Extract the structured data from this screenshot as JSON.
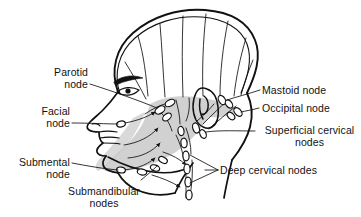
{
  "figure": {
    "type": "anatomical-line-diagram",
    "background_color": "#ffffff",
    "ink_color": "#111111",
    "shading_color": "#c9c9c9",
    "node_fill_color": "#ffffff"
  },
  "labels": {
    "parotid": {
      "line1": "Parotid",
      "line2": "node"
    },
    "facial": {
      "line1": "Facial",
      "line2": "node"
    },
    "submental": {
      "line1": "Submental",
      "line2": "node"
    },
    "submandibular": {
      "line1": "Submandibular",
      "line2": "nodes"
    },
    "mastoid": {
      "line1": "Mastoid node"
    },
    "occipital": {
      "line1": "Occipital node"
    },
    "superficial_cervical": {
      "line1": "Superficial cervical",
      "line2": "nodes"
    },
    "deep_cervical": {
      "line1": "Deep cervical nodes"
    }
  },
  "node_groups": [
    {
      "name": "parotid-node",
      "count": 3
    },
    {
      "name": "facial-node",
      "count": 1
    },
    {
      "name": "submental-node",
      "count": 1
    },
    {
      "name": "submandibular-nodes",
      "count": 3
    },
    {
      "name": "mastoid-node",
      "count": 2
    },
    {
      "name": "occipital-node",
      "count": 2
    },
    {
      "name": "superficial-cervical-nodes",
      "count": 2
    },
    {
      "name": "deep-cervical-nodes",
      "count": 6
    }
  ]
}
